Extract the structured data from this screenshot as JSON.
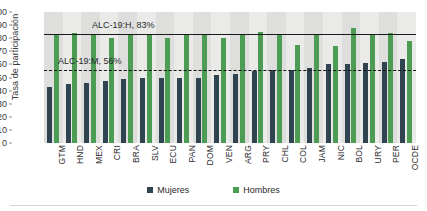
{
  "chart_data": {
    "type": "bar",
    "title": "",
    "subtitle": "",
    "xlabel": "",
    "ylabel": "Tasa de participación",
    "ylim": [
      0,
      100
    ],
    "ytick_step": 10,
    "yticks": [
      0,
      10,
      20,
      30,
      40,
      50,
      60,
      70,
      80,
      90,
      100
    ],
    "grid": false,
    "legend_position": "bottom",
    "categories": [
      "GTM",
      "HND",
      "MEX",
      "CRI",
      "BRA",
      "SLV",
      "ECU",
      "PAN",
      "DOM",
      "VEN",
      "ARG",
      "PRY",
      "CHL",
      "COL",
      "JAM",
      "NIC",
      "BOL",
      "URY",
      "PER",
      "OCDE"
    ],
    "series": [
      {
        "name": "Mujeres",
        "color": "#2f4350",
        "values": [
          43,
          45,
          46,
          47,
          49,
          50,
          50,
          50,
          50,
          52,
          53,
          55,
          56,
          56,
          57,
          60,
          60,
          61,
          62,
          64
        ]
      },
      {
        "name": "Hombres",
        "color": "#4c9c54",
        "values": [
          83,
          84,
          83,
          80,
          83,
          83,
          80,
          83,
          83,
          80,
          83,
          85,
          83,
          75,
          83,
          74,
          88,
          83,
          84,
          78
        ]
      }
    ],
    "annotations": [
      {
        "id": "alc-hombres",
        "label": "ALC-19:H, 83%",
        "value": 83,
        "style": "solid"
      },
      {
        "id": "alc-mujeres",
        "label": "ALC-19:M, 56%",
        "value": 56,
        "style": "dashed"
      }
    ],
    "legend": [
      {
        "label": "Mujeres",
        "color": "#2f4350"
      },
      {
        "label": "Hombres",
        "color": "#4c9c54"
      }
    ]
  }
}
